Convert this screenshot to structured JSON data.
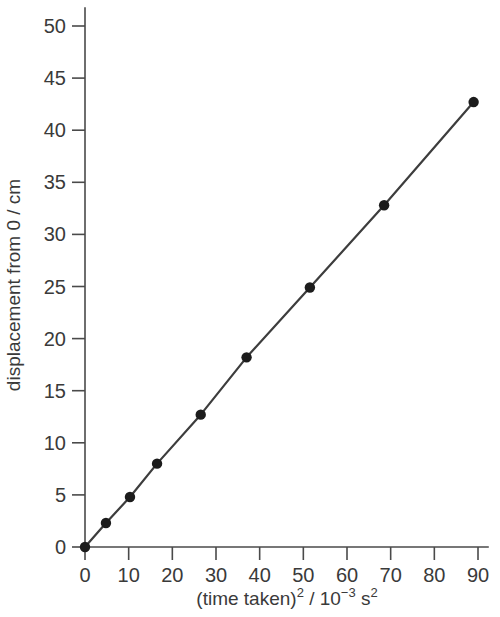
{
  "chart_data": {
    "type": "line",
    "title": "",
    "xlabel": "(time taken)2 / 10-3 s2",
    "xlabel_parts": {
      "lead": "(time taken)",
      "sup1": "2",
      "mid": " / 10",
      "sup2": "−3",
      "tail": " s",
      "sup3": "2"
    },
    "ylabel": "displacement from 0 / cm",
    "xlim": [
      0,
      92
    ],
    "ylim": [
      0,
      52
    ],
    "xticks": [
      0,
      10,
      20,
      30,
      40,
      50,
      60,
      70,
      80,
      90
    ],
    "yticks": [
      0,
      5,
      10,
      15,
      20,
      25,
      30,
      35,
      40,
      45,
      50
    ],
    "xticklabels": [
      "0",
      "10",
      "20",
      "30",
      "40",
      "50",
      "60",
      "70",
      "80",
      "90"
    ],
    "yticklabels": [
      "0",
      "5",
      "10",
      "15",
      "20",
      "25",
      "30",
      "35",
      "40",
      "45",
      "50"
    ],
    "grid": false,
    "legend": false,
    "marker": "filled-circle",
    "line_color": "#3d3d3d",
    "marker_color": "#1c1c1c",
    "axis_color": "#4a4a4a",
    "background": "#ffffff",
    "x": [
      0,
      4.8,
      10.3,
      16.5,
      26.5,
      37.0,
      51.5,
      68.5,
      89.0
    ],
    "y": [
      0,
      2.3,
      4.8,
      8.0,
      12.7,
      18.2,
      24.9,
      32.8,
      42.7
    ],
    "points": [
      {
        "x": 0,
        "y": 0
      },
      {
        "x": 4.8,
        "y": 2.3
      },
      {
        "x": 10.3,
        "y": 4.8
      },
      {
        "x": 16.5,
        "y": 8.0
      },
      {
        "x": 26.5,
        "y": 12.7
      },
      {
        "x": 37.0,
        "y": 18.2
      },
      {
        "x": 51.5,
        "y": 24.9
      },
      {
        "x": 68.5,
        "y": 32.8
      },
      {
        "x": 89.0,
        "y": 42.7
      }
    ]
  }
}
